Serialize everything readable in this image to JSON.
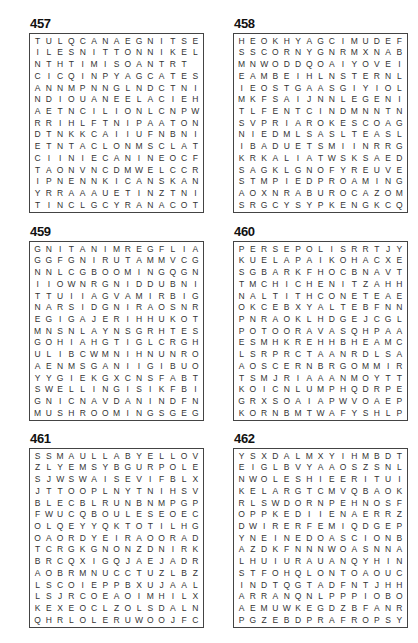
{
  "puzzles": [
    {
      "number": "457",
      "rows": [
        "TULQCANAEGNITSE",
        "ILESNITTONNIKEL",
        "NTHTIMISOANTRT",
        "CICQINPYAGCATES",
        "ANNMPNNGLNDCTNI",
        "NDIOUANEELACIEH",
        "AETNCILIONLCNPW",
        "RRIHLFTNIPAATON",
        "DTNKKCAIIUFNBNI",
        "ETNTACLONMSCLAT",
        "CIINIECANINEOCF",
        "TAONVNCDMWELCCR",
        "IPNENNKICANSKAN",
        "YRRAAAUETINZTNI",
        "TINCLGCYRANACOT"
      ]
    },
    {
      "number": "458",
      "rows": [
        "HEOKHYAGCIMUDEF",
        "SSCORNYGNRMXNAB",
        "MNWODDQOAIYOVEI",
        "EAMBEIHLNSTERNL",
        "IEOSTGAASGIYIOL",
        "MKFSAIJNNLEGENI",
        "TLFENTCINDMNNTN",
        "SVPRIAROKESCOAG",
        "NIEDMLSASLTEASL",
        "IBADUETSMIINRRG",
        "KRKALIATWSKSAED",
        "SAGKLGNOFYREUVE",
        "STMPIEDPROAMING",
        "AOXNRABUROCAZOM",
        "SRGCYSYPKENGKCQ"
      ]
    },
    {
      "number": "459",
      "rows": [
        "GNITANIMREGFLIA",
        "GGFGNIRUTAMMVCG",
        "NNLCGBOOMINGQGN",
        "IIOWNRGNIDDUBNI",
        "TTUIIAGVAMIRBIG",
        "NARSIDGNIRAOSNR",
        "EGIGAJERIHHUKOT",
        "MNSNLAYNSGRHTES",
        "GOHIAHGTIGLCRGH",
        "ULIBCWMNIHNUNRO",
        "AENMSGANIIGIBUO",
        "YYGIEKGXCNSFABT",
        "SWELLINGISIKFBI",
        "GNICNAVDANINDFN",
        "MUSHROOMINGSGEG"
      ]
    },
    {
      "number": "460",
      "rows": [
        "PERSEPOLISRRTJY",
        "KUELAPAIKOHACXE",
        "SGBARKFHOCBNAVT",
        "TMCHICHENITZAHH",
        "NALTITHCONETEAE",
        "OKCEBXYALTEBFNN",
        "PNRAOKLHDGEJCGL",
        "POTOORAVASQHPAA",
        "ESMHKREHHBHEAMC",
        "LSRPRCTAANRDLSA",
        "AOSCERNBRGOMMIR",
        "TSMJRIAAANMOYTT",
        "KOICNLUMPHQDRPE",
        "GRXSOAIAPWVOAEP",
        "KORNBMTWAFYSHLP"
      ]
    },
    {
      "number": "461",
      "rows": [
        "SSMAULLABYELLOV",
        "ZLYEMSYBGURPOLE",
        "SJWSWAISEVIFBLX",
        "JTTOOPLNYTNIHSV",
        "BLECBLRUNBNMPGP",
        "FWUCQBOULESEOEC",
        "OLQEYYQKTOTILHG",
        "OAORDYEIRAOORAD",
        "TCRGKGNONZDNIRK",
        "BRCQXIGQJAEJADR",
        "AOBRMNUCCTUZLBZ",
        "LSCOIEPPBXUJAAL",
        "LSJRCOEAOIMHILX",
        "KEXEOCLZOLSDALN",
        "QHRLOLERUWOOJFC"
      ]
    },
    {
      "number": "462",
      "rows": [
        "YSXDALMXYIHMBDT",
        "EIGLBVYAAOSZSNL",
        "NWOLESHIEERITUI",
        "KELARGTCMVQBAOK",
        "RLSWDORNPEHNOSF",
        "OPPKEDIIENAERRZ",
        "DWIRERFEMIQDGEP",
        "YNEINEDOASCIONB",
        "AZDKFNNNWOASNNA",
        "LHUIURAUANQYHIN",
        "STFOHQLONTOAOUC",
        "INDTQGTADFNTJHH",
        "ARRANQNLPPPIOBO",
        "AEMUWKEGDZBFANR",
        "PGZEBDPRAFROPSY"
      ]
    }
  ]
}
